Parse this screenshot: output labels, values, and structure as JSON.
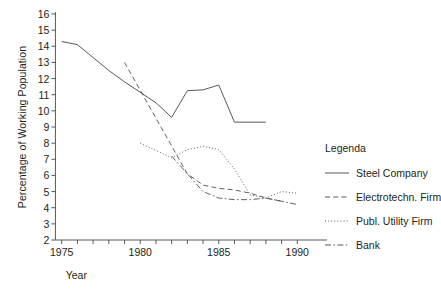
{
  "chart_data": {
    "type": "line",
    "title": "",
    "xlabel": "Year",
    "ylabel": "Percentage of Working Population",
    "xlim": [
      1974,
      1991
    ],
    "ylim": [
      2,
      16
    ],
    "grid": false,
    "legend_position": "right",
    "legend_title": "Legenda",
    "x_ticks": [
      1975,
      1976,
      1977,
      1978,
      1979,
      1980,
      1981,
      1982,
      1983,
      1984,
      1985,
      1986,
      1987,
      1988,
      1989,
      1990
    ],
    "x_tick_labels": [
      "1975",
      "",
      "",
      "",
      "",
      "1980",
      "",
      "",
      "",
      "",
      "1985",
      "",
      "",
      "",
      "",
      "1990"
    ],
    "y_ticks": [
      2,
      3,
      4,
      5,
      6,
      7,
      8,
      9,
      10,
      11,
      12,
      13,
      14,
      15,
      16
    ],
    "y_tick_labels": [
      "2",
      "3",
      "4",
      "5",
      "6",
      "7",
      "8",
      "9",
      "10",
      "11",
      "12",
      "13",
      "14",
      "15",
      "16"
    ],
    "series": [
      {
        "name": "Steel Company",
        "style": "solid",
        "x": [
          1975,
          1976,
          1978,
          1979,
          1981,
          1982,
          1983,
          1984,
          1985,
          1986,
          1988
        ],
        "values": [
          14.3,
          14.1,
          12.5,
          11.8,
          10.5,
          9.6,
          11.25,
          11.3,
          11.6,
          9.3,
          9.3
        ]
      },
      {
        "name": "Electrotechn. Firm",
        "style": "dashed",
        "x": [
          1979,
          1983,
          1984,
          1985,
          1986,
          1987,
          1988,
          1989
        ],
        "values": [
          13.0,
          6.1,
          5.4,
          5.2,
          5.1,
          4.9,
          4.6,
          4.4
        ]
      },
      {
        "name": "Publ. Utility Firm",
        "style": "dotted",
        "x": [
          1980,
          1982,
          1983,
          1984,
          1985,
          1986,
          1987,
          1988,
          1989,
          1990
        ],
        "values": [
          8.0,
          7.1,
          7.6,
          7.8,
          7.6,
          6.4,
          4.8,
          4.6,
          5.0,
          4.9
        ]
      },
      {
        "name": "Bank",
        "style": "dashdot",
        "x": [
          1982,
          1983,
          1984,
          1985,
          1986,
          1987,
          1988,
          1989,
          1990
        ],
        "values": [
          7.2,
          6.1,
          5.0,
          4.6,
          4.5,
          4.5,
          4.6,
          4.4,
          4.2
        ]
      }
    ]
  },
  "legend": {
    "title": "Legenda",
    "items": [
      {
        "label": "Steel Company",
        "style": "solid"
      },
      {
        "label": "Electrotechn. Firm",
        "style": "dashed"
      },
      {
        "label": "Publ. Utility Firm",
        "style": "dotted"
      },
      {
        "label": "Bank",
        "style": "dashdot"
      }
    ]
  },
  "axes": {
    "x_title": "Year",
    "y_title": "Percentage of Working Population"
  },
  "colors": {
    "line": "#58595b",
    "text": "#231f20",
    "background": "#ffffff"
  }
}
